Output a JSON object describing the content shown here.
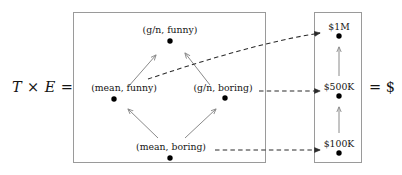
{
  "equation": {
    "left_label": "T × E =",
    "right_label": "= $"
  },
  "domain_box": {
    "name": "product-space-box",
    "nodes": [
      {
        "label": "(g/n, funny)",
        "x": 170,
        "y": 41,
        "label_x": 170,
        "label_y": 24
      },
      {
        "label": "(mean, funny)",
        "x": 114,
        "y": 99,
        "label_x": 124,
        "label_y": 82
      },
      {
        "label": "(g/n, boring)",
        "x": 225,
        "y": 98,
        "label_x": 223,
        "label_y": 82
      },
      {
        "label": "(mean, boring)",
        "x": 170,
        "y": 158,
        "label_x": 171,
        "label_y": 141
      }
    ]
  },
  "codomain_box": {
    "name": "money-box",
    "nodes": [
      {
        "label": "$1M",
        "x": 339,
        "y": 36,
        "label_x": 339,
        "label_y": 21
      },
      {
        "label": "$500K",
        "x": 339,
        "y": 96,
        "label_x": 339,
        "label_y": 81
      },
      {
        "label": "$100K",
        "x": 339,
        "y": 153,
        "label_x": 339,
        "label_y": 138
      }
    ]
  },
  "arrows": {
    "order_arrows": [
      {
        "from": "(mean, funny)",
        "to": "(g/n, funny)",
        "style": "solid"
      },
      {
        "from": "(g/n, boring)",
        "to": "(g/n, funny)",
        "style": "solid"
      },
      {
        "from": "(mean, boring)",
        "to": "(mean, funny)",
        "style": "solid"
      },
      {
        "from": "(mean, boring)",
        "to": "(g/n, boring)",
        "style": "solid"
      },
      {
        "from": "$500K",
        "to": "$1M",
        "style": "solid"
      },
      {
        "from": "$100K",
        "to": "$500K",
        "style": "solid"
      }
    ],
    "map_arrows": [
      {
        "from": "(mean, funny)",
        "to": "$1M",
        "style": "dashed-curved"
      },
      {
        "from": "(g/n, boring)",
        "to": "$500K",
        "style": "dashed"
      },
      {
        "from": "(mean, boring)",
        "to": "$100K",
        "style": "dashed"
      }
    ]
  },
  "colors": {
    "box_stroke": "#9a9a9a",
    "solid_arrow": "#8a8a8a",
    "dashed_arrow": "#2b2b2b",
    "node_dot": "#000000",
    "text": "#151515"
  }
}
